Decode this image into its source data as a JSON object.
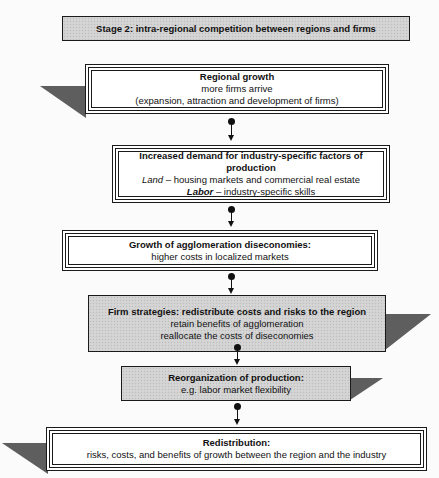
{
  "header": {
    "title": "Stage 2: intra-regional competition between regions and firms"
  },
  "boxes": [
    {
      "id": "regional-growth",
      "title": "Regional growth",
      "lines": [
        "more firms arrive",
        "(expansion, attraction and development of firms)"
      ]
    },
    {
      "id": "increased-demand",
      "title": "Increased demand for industry-specific factors of production",
      "land_label": "Land",
      "land_text": " – housing markets and commercial real estate",
      "labor_label": "Labor",
      "labor_text": " – industry-specific skills"
    },
    {
      "id": "agglomeration-diseconomies",
      "title": "Growth of agglomeration diseconomies:",
      "lines": [
        "higher costs in localized markets"
      ]
    },
    {
      "id": "firm-strategies",
      "title": "Firm strategies: redistribute costs and risks to the region",
      "lines": [
        "retain benefits of agglomeration",
        "reallocate the costs of diseconomies"
      ]
    },
    {
      "id": "reorganization",
      "title": "Reorganization of production:",
      "lines": [
        "e.g. labor market flexibility"
      ]
    },
    {
      "id": "redistribution",
      "title": "Redistribution:",
      "lines": [
        "risks, costs, and benefits of growth between the region and the industry"
      ]
    }
  ],
  "colors": {
    "gray_fill": "#d2d2d2",
    "border": "#1a1a1a",
    "shadow": "#7a7a7a",
    "background": "#fbfbfb"
  }
}
